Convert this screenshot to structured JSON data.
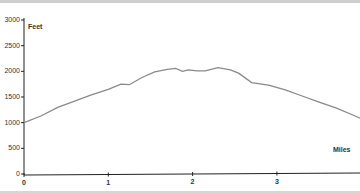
{
  "chart_data": {
    "type": "line",
    "title": "",
    "xlabel": "Miles",
    "ylabel": "Feet",
    "xlim": [
      0,
      4.0
    ],
    "ylim": [
      0,
      3000
    ],
    "xticks": [
      "0",
      "1",
      "2",
      "3"
    ],
    "yticks": [
      "0",
      "500",
      "1000",
      "1500",
      "2000",
      "2500",
      "3000"
    ],
    "grid": false,
    "legend": null,
    "series": [
      {
        "name": "Elevation profile",
        "color": "#8a8a8a",
        "x": [
          0,
          0.2,
          0.4,
          0.6,
          0.8,
          1.0,
          1.15,
          1.25,
          1.4,
          1.55,
          1.7,
          1.8,
          1.88,
          1.95,
          2.05,
          2.15,
          2.3,
          2.45,
          2.55,
          2.7,
          2.9,
          3.1,
          3.3,
          3.5,
          3.7,
          3.9,
          4.0
        ],
        "y": [
          1000,
          1130,
          1300,
          1420,
          1540,
          1650,
          1750,
          1740,
          1880,
          1990,
          2040,
          2060,
          2000,
          2030,
          2010,
          2010,
          2070,
          2030,
          1960,
          1780,
          1730,
          1640,
          1520,
          1400,
          1290,
          1150,
          1080
        ]
      }
    ]
  }
}
